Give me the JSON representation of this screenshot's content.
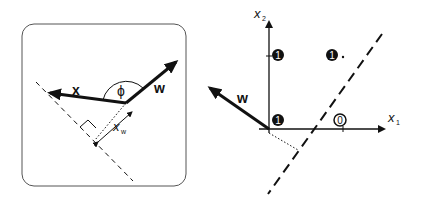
{
  "left_panel": {
    "vector_x_label": "x",
    "vector_w_label": "w",
    "angle_label": "ϕ",
    "projection_label": "x",
    "projection_subscript": "w"
  },
  "right_panel": {
    "axis_x1_label": "x",
    "axis_x1_subscript": "1",
    "axis_x2_label": "x",
    "axis_x2_subscript": "2",
    "vector_w_label": "w",
    "points": [
      {
        "label": "1",
        "position": "(0,1)",
        "filled": true
      },
      {
        "label": "1",
        "position": "(1,1)",
        "filled": true
      },
      {
        "label": "1",
        "position": "(0,0)",
        "filled": true
      },
      {
        "label": "0",
        "position": "(1,0)",
        "filled": false
      }
    ]
  },
  "colors": {
    "stroke": "#111111",
    "background": "#ffffff",
    "frame": "#555555"
  }
}
